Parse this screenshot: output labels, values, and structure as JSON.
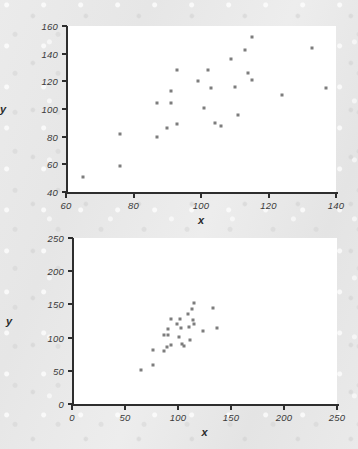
{
  "figure": {
    "background_color": "#e8e8e8",
    "point_color": "#7d7d7d",
    "axis_color": "#2e2e2e"
  },
  "chart_data": [
    {
      "type": "scatter",
      "panel": "top",
      "title": "",
      "xlabel": "x",
      "ylabel": "y",
      "xlim": [
        60,
        140
      ],
      "ylim": [
        40,
        160
      ],
      "xticks": [
        60,
        80,
        100,
        120,
        140
      ],
      "yticks": [
        40,
        60,
        80,
        100,
        120,
        140,
        160
      ],
      "grid": false,
      "legend": false,
      "x": [
        65,
        76,
        76,
        87,
        87,
        90,
        91,
        91,
        93,
        93,
        99,
        101,
        102,
        103,
        104,
        106,
        109,
        110,
        111,
        113,
        114,
        115,
        115,
        124,
        133,
        137
      ],
      "y": [
        51,
        59,
        82,
        80,
        104,
        86,
        104,
        113,
        89,
        128,
        120,
        101,
        128,
        115,
        90,
        88,
        136,
        116,
        96,
        143,
        126,
        121,
        152,
        110,
        144,
        115
      ]
    },
    {
      "type": "scatter",
      "panel": "bottom",
      "title": "",
      "xlabel": "x",
      "ylabel": "y",
      "xlim": [
        0,
        250
      ],
      "ylim": [
        0,
        250
      ],
      "xticks": [
        0,
        50,
        100,
        150,
        200,
        250
      ],
      "yticks": [
        0,
        50,
        100,
        150,
        200,
        250
      ],
      "grid": false,
      "legend": false,
      "x": [
        65,
        76,
        76,
        87,
        87,
        90,
        91,
        91,
        93,
        93,
        99,
        101,
        102,
        103,
        104,
        106,
        109,
        110,
        111,
        113,
        114,
        115,
        115,
        124,
        133,
        137
      ],
      "y": [
        51,
        59,
        82,
        80,
        104,
        86,
        104,
        113,
        89,
        128,
        120,
        101,
        128,
        115,
        90,
        88,
        136,
        116,
        96,
        143,
        126,
        121,
        152,
        110,
        144,
        115
      ]
    }
  ]
}
